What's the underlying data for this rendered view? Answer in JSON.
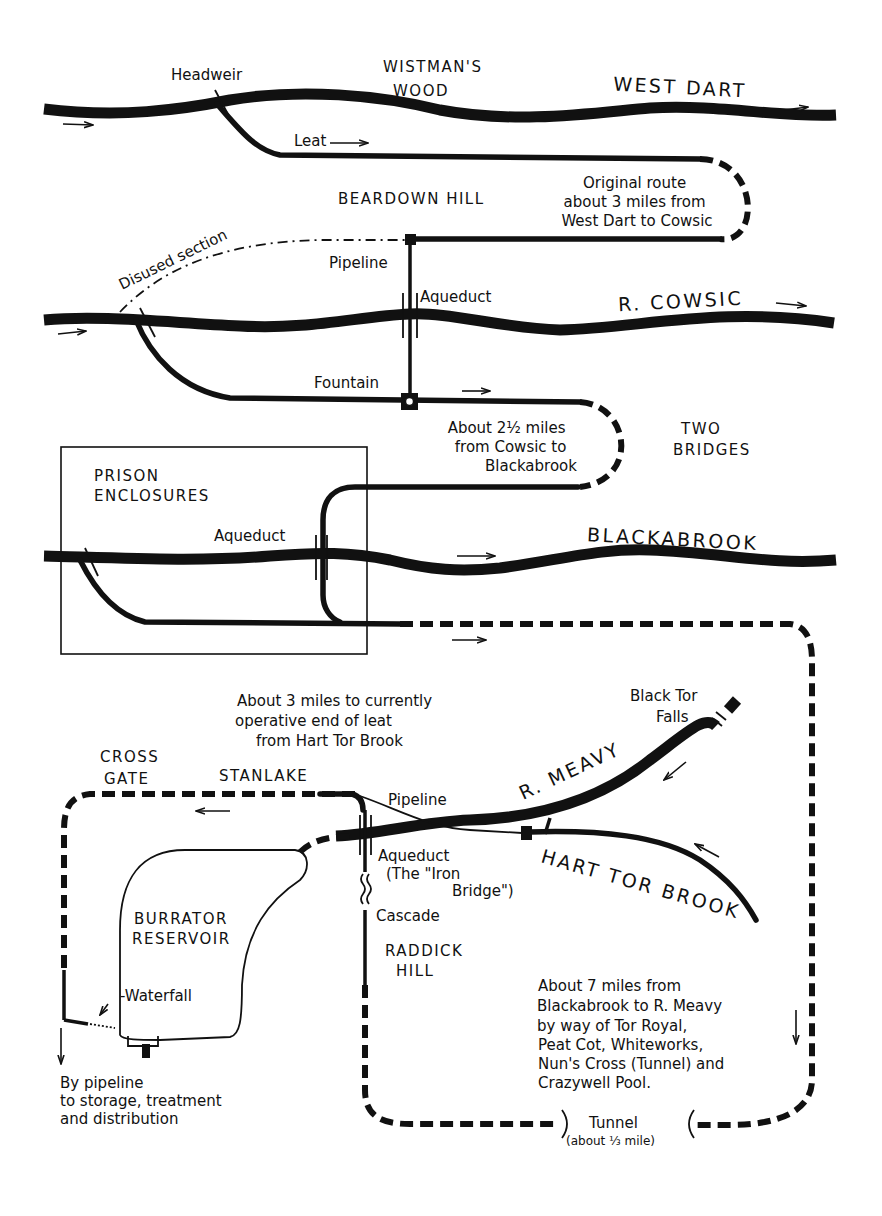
{
  "map": {
    "title": "Devonport Leat route map",
    "colors": {
      "ink": "#111111",
      "paper": "#ffffff"
    },
    "rivers": {
      "west_dart": "WEST DART",
      "cowsic": "R. COWSIC",
      "blackabrook": "BLACKABROOK",
      "meavy": "R. MEAVY",
      "hart_tor_brook": "HART TOR BROOK"
    },
    "places": {
      "wistmans_wood_line1": "WISTMAN'S",
      "wistmans_wood_line2": "WOOD",
      "beardown_hill": "BEARDOWN HILL",
      "two_bridges_line1": "TWO",
      "two_bridges_line2": "BRIDGES",
      "prison_line1": "PRISON",
      "prison_line2": "ENCLOSURES",
      "cross_gate_line1": "CROSS",
      "cross_gate_line2": "GATE",
      "stanlake": "STANLAKE",
      "raddick_line1": "RADDICK",
      "raddick_line2": "HILL",
      "burrator_line1": "BURRATOR",
      "burrator_line2": "RESERVOIR",
      "black_tor_line1": "Black Tor",
      "black_tor_line2": "Falls"
    },
    "features": {
      "headweir": "Headweir",
      "leat": "Leat",
      "disused_section": "Disused section",
      "pipeline_upper": "Pipeline",
      "aqueduct_cowsic": "Aqueduct",
      "fountain": "Fountain",
      "aqueduct_blackabrook": "Aqueduct",
      "pipeline_lower": "Pipeline",
      "aqueduct_iron_line1": "Aqueduct",
      "aqueduct_iron_line2": "(The \"Iron",
      "aqueduct_iron_line3": "Bridge\")",
      "cascade": "Cascade",
      "waterfall": "-Waterfall",
      "tunnel": "Tunnel",
      "tunnel_length": "(about ⅓ mile)"
    },
    "notes": {
      "original_route": [
        "Original route",
        "about 3 miles from",
        "West Dart to Cowsic"
      ],
      "cowsic_to_blackabrook": [
        "About 2½ miles",
        "from Cowsic to",
        "Blackabrook"
      ],
      "hart_tor": [
        "About 3 miles to currently",
        "operative end of leat",
        "from Hart Tor Brook"
      ],
      "blackabrook_to_meavy": [
        "About 7 miles from",
        "Blackabrook to R. Meavy",
        "by way of Tor Royal,",
        "Peat Cot, Whiteworks,",
        "Nun's Cross (Tunnel) and",
        "Crazywell Pool."
      ],
      "distribution": [
        "By pipeline",
        "to storage, treatment",
        "and distribution"
      ]
    }
  }
}
